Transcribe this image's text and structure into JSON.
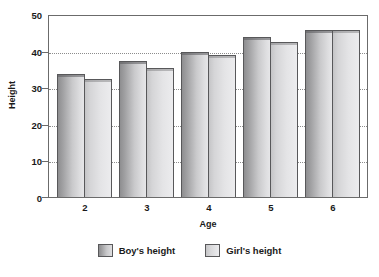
{
  "chart_data": {
    "type": "bar",
    "title": "",
    "xlabel": "Age",
    "ylabel": "Height",
    "categories": [
      "2",
      "3",
      "4",
      "5",
      "6"
    ],
    "series": [
      {
        "name": "Boy's height",
        "color": "#b5b5b7",
        "values": [
          34,
          37.5,
          40,
          44,
          46
        ]
      },
      {
        "name": "Girl's height",
        "color": "#e0e0e2",
        "values": [
          32.5,
          35.5,
          39,
          42.5,
          46
        ]
      }
    ],
    "ylim": [
      0,
      50
    ],
    "yticks": [
      0,
      10,
      20,
      30,
      40,
      50
    ],
    "ytick_labels": [
      "0",
      "10",
      "20",
      "30",
      "40",
      "50"
    ],
    "grid": true,
    "grid_axis": "y",
    "legend_position": "bottom"
  },
  "legend": {
    "items": [
      {
        "label": "Boy's height",
        "swatch": "boy-swatch-icon"
      },
      {
        "label": "Girl's height",
        "swatch": "girl-swatch-icon"
      }
    ]
  },
  "colors": {
    "axis": "#6b6b6b",
    "gridline": "#8c8c8c",
    "text": "#1a1a1a",
    "background": "#ffffff"
  }
}
